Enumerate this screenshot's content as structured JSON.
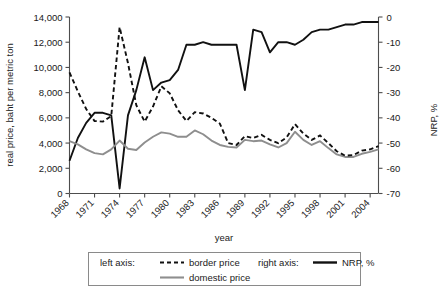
{
  "chart_data": {
    "type": "line",
    "title": "",
    "xlabel": "year",
    "ylabel": "real price, baht per metric ton",
    "y2label": "NRP, %",
    "xlim": [
      1968,
      2005
    ],
    "ylim": [
      0,
      14000
    ],
    "y2lim": [
      -70,
      0
    ],
    "grid": false,
    "legend_position": "bottom",
    "x": [
      1968,
      1969,
      1970,
      1971,
      1972,
      1973,
      1974,
      1975,
      1976,
      1977,
      1978,
      1979,
      1980,
      1981,
      1982,
      1983,
      1984,
      1985,
      1986,
      1987,
      1988,
      1989,
      1990,
      1991,
      1992,
      1993,
      1994,
      1995,
      1996,
      1997,
      1998,
      1999,
      2000,
      2001,
      2002,
      2003,
      2004,
      2005
    ],
    "xticks": [
      1968,
      1971,
      1974,
      1977,
      1980,
      1983,
      1986,
      1989,
      1992,
      1995,
      1998,
      2001,
      2004
    ],
    "xticklabels": [
      "1968",
      "1971",
      "1974",
      "1977",
      "1980",
      "1983",
      "1986",
      "1989",
      "1992",
      "1995",
      "1998",
      "2001",
      "2004"
    ],
    "yticks": [
      0,
      2000,
      4000,
      6000,
      8000,
      10000,
      12000,
      14000
    ],
    "yticklabels": [
      "0",
      "2,000",
      "4,000",
      "6,000",
      "8,000",
      "10,000",
      "12,000",
      "14,000"
    ],
    "y2ticks": [
      0,
      -10,
      -20,
      -30,
      -40,
      -50,
      -60,
      -70
    ],
    "y2ticklabels": [
      "0",
      "-10",
      "-20",
      "-30",
      "-40",
      "-50",
      "-60",
      "-70"
    ],
    "series": [
      {
        "name": "border price",
        "axis": "left",
        "style": "dashed",
        "color": "#111111",
        "values": [
          9600,
          8100,
          6700,
          5750,
          5700,
          6150,
          13200,
          10350,
          7000,
          5700,
          6900,
          8500,
          7950,
          6600,
          5750,
          6450,
          6350,
          6000,
          5550,
          4000,
          3850,
          4550,
          4400,
          4650,
          4250,
          4000,
          4450,
          5500,
          4750,
          4250,
          4600,
          4000,
          3350,
          3000,
          3050,
          3400,
          3500,
          3750
        ]
      },
      {
        "name": "domestic price",
        "axis": "left",
        "style": "solid",
        "color": "#8e8e8e",
        "values": [
          4150,
          3900,
          3500,
          3200,
          3100,
          3500,
          4200,
          3550,
          3450,
          4050,
          4500,
          4850,
          4750,
          4500,
          4500,
          5000,
          4700,
          4200,
          3850,
          3700,
          3650,
          4250,
          4150,
          4200,
          3900,
          3650,
          4000,
          4900,
          4250,
          3850,
          4150,
          3600,
          3100,
          2900,
          2900,
          3150,
          3300,
          3500
        ]
      },
      {
        "name": "NRP, %",
        "axis": "right",
        "style": "solid",
        "color": "#111111",
        "values": [
          -57,
          -48,
          -42,
          -38,
          -38,
          -39,
          -68,
          -39,
          -29,
          -16,
          -29,
          -26,
          -25,
          -21,
          -11,
          -11,
          -10,
          -11,
          -11,
          -11,
          -11,
          -29,
          -5,
          -6,
          -14,
          -10,
          -10,
          -11,
          -9,
          -6,
          -5,
          -5,
          -4,
          -3,
          -3,
          -2,
          -2,
          -2
        ]
      }
    ]
  },
  "axes": {
    "left_title": "real price, baht per metric ton",
    "right_title": "NRP, %",
    "x_title": "year"
  },
  "legend": {
    "left_axis_label": "left axis:",
    "right_axis_label": "right axis:",
    "items": [
      {
        "label": "border price",
        "style": "dashed",
        "color": "#111111"
      },
      {
        "label": "domestic price",
        "style": "solid",
        "color": "#8e8e8e"
      },
      {
        "label": "NRP, %",
        "style": "solid",
        "color": "#111111"
      }
    ]
  }
}
